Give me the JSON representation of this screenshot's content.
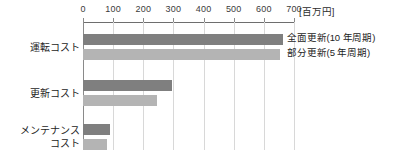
{
  "chart_data": {
    "type": "bar",
    "orientation": "horizontal",
    "title": "",
    "subtitle": "",
    "xlabel": "[百万円]",
    "ylabel": "",
    "unit_label": "[百万円]",
    "categories": [
      "運転コスト",
      "更新コスト",
      "メンテナンス\nコスト"
    ],
    "series": [
      {
        "name": "全面更新(10 年周期)",
        "color": "#7f7f7f",
        "values": [
          665,
          295,
          90
        ]
      },
      {
        "name": "部分更新(5 年周期)",
        "color": "#b4b4b4",
        "values": [
          655,
          247,
          80
        ]
      }
    ],
    "xlim": [
      0,
      700
    ],
    "xticks": [
      0,
      100,
      200,
      300,
      400,
      500,
      600,
      700
    ],
    "xtick_labels": [
      "0",
      "100",
      "200",
      "300",
      "400",
      "500",
      "600",
      "700"
    ],
    "grid": true,
    "grid_axis": "x",
    "legend_position": "inside-top-right"
  },
  "legend": {
    "entries": [
      {
        "label": "全面更新(10 年周期)"
      },
      {
        "label": "部分更新(5 年周期)"
      }
    ]
  },
  "axis": {
    "unit": "[百万円]"
  }
}
